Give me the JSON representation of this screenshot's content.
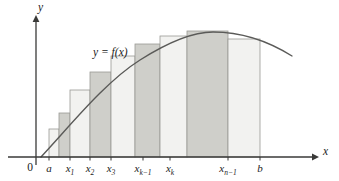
{
  "figure": {
    "colors": {
      "bar_light": "#f2f2f0",
      "bar_dark": "#cfcfca",
      "bar_stroke": "#9a9a95",
      "curve": "#5a5a58",
      "axis": "#3a3a38",
      "text": "#1b1b1b",
      "background": "#ffffff"
    },
    "axes": {
      "y_axis_label": "y",
      "x_axis_label": "x",
      "origin_label": "0",
      "x_axis_y_px": 157,
      "y_axis_x_px": 36,
      "x_axis_end_px": 312,
      "y_axis_top_px": 22
    },
    "curve": {
      "label": "y = f(x)",
      "label_x_px": 93,
      "label_y_px": 47,
      "path": "M 41,157 C 70,126 105,82 140,60 C 170,41 195,32 213,32 C 240,32 268,41 292,56"
    },
    "ticks": [
      {
        "name": "a",
        "main": "a",
        "sub": "",
        "x_px": 49
      },
      {
        "name": "x1",
        "main": "x",
        "sub": "1",
        "x_px": 70
      },
      {
        "name": "x2",
        "main": "x",
        "sub": "2",
        "x_px": 90
      },
      {
        "name": "x3",
        "main": "x",
        "sub": "3",
        "x_px": 111
      },
      {
        "name": "xk-1",
        "main": "x",
        "sub": "k−1",
        "x_px": 143
      },
      {
        "name": "xk",
        "main": "x",
        "sub": "k",
        "x_px": 170
      },
      {
        "name": "xn-1",
        "main": "x",
        "sub": "n−1",
        "x_px": 228
      },
      {
        "name": "b",
        "main": "b",
        "sub": "",
        "x_px": 260
      }
    ],
    "bars": [
      {
        "index": 0,
        "x0_px": 49,
        "x1_px": 59,
        "top_px": 129,
        "shade": "light"
      },
      {
        "index": 1,
        "x0_px": 59,
        "x1_px": 70,
        "top_px": 113,
        "shade": "dark"
      },
      {
        "index": 2,
        "x0_px": 70,
        "x1_px": 90,
        "top_px": 90,
        "shade": "light"
      },
      {
        "index": 3,
        "x0_px": 90,
        "x1_px": 111,
        "top_px": 72,
        "shade": "dark"
      },
      {
        "index": 4,
        "x0_px": 111,
        "x1_px": 135,
        "top_px": 56,
        "shade": "light"
      },
      {
        "index": 5,
        "x0_px": 135,
        "x1_px": 160,
        "top_px": 44,
        "shade": "dark"
      },
      {
        "index": 6,
        "x0_px": 160,
        "x1_px": 187,
        "top_px": 36,
        "shade": "light"
      },
      {
        "index": 7,
        "x0_px": 187,
        "x1_px": 228,
        "top_px": 31,
        "shade": "dark"
      },
      {
        "index": 8,
        "x0_px": 228,
        "x1_px": 260,
        "top_px": 39,
        "shade": "light"
      }
    ]
  }
}
